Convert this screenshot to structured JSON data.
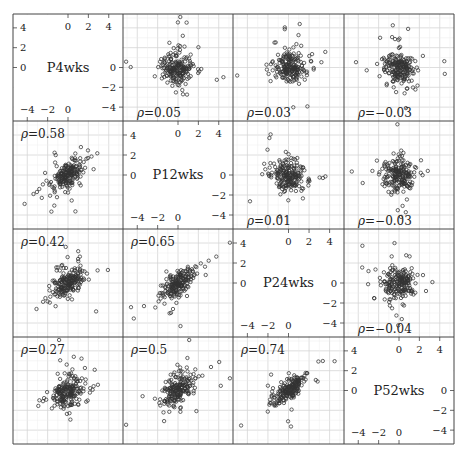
{
  "chart_data": {
    "type": "scatter",
    "title": "",
    "layout": "scatterplot-matrix",
    "variables": [
      "P4wks",
      "P12wks",
      "P24wks",
      "P52wks"
    ],
    "axis_range": [
      -5.4,
      5.4
    ],
    "ticks": [
      -4,
      -2,
      0,
      2,
      4
    ],
    "grid": true,
    "grid_step": 2,
    "correlations": [
      {
        "row": 0,
        "col": 1,
        "label": "ρ=0.05",
        "value": 0.05,
        "pos": "lower-left"
      },
      {
        "row": 0,
        "col": 2,
        "label": "ρ=0.03",
        "value": 0.03,
        "pos": "lower-left"
      },
      {
        "row": 0,
        "col": 3,
        "label": "ρ=−0.03",
        "value": -0.03,
        "pos": "lower-left"
      },
      {
        "row": 1,
        "col": 0,
        "label": "ρ=0.58",
        "value": 0.58,
        "pos": "upper-left"
      },
      {
        "row": 1,
        "col": 2,
        "label": "ρ=0.01",
        "value": 0.01,
        "pos": "lower-left"
      },
      {
        "row": 1,
        "col": 3,
        "label": "ρ=−0.03",
        "value": -0.03,
        "pos": "lower-left"
      },
      {
        "row": 2,
        "col": 0,
        "label": "ρ=0.42",
        "value": 0.42,
        "pos": "upper-left"
      },
      {
        "row": 2,
        "col": 1,
        "label": "ρ=0.65",
        "value": 0.65,
        "pos": "upper-left"
      },
      {
        "row": 2,
        "col": 3,
        "label": "ρ=−0.04",
        "value": -0.04,
        "pos": "lower-left"
      },
      {
        "row": 3,
        "col": 0,
        "label": "ρ=0.27",
        "value": 0.27,
        "pos": "upper-left"
      },
      {
        "row": 3,
        "col": 1,
        "label": "ρ=0.5",
        "value": 0.5,
        "pos": "upper-left"
      },
      {
        "row": 3,
        "col": 2,
        "label": "ρ=0.74",
        "value": 0.74,
        "pos": "upper-left"
      }
    ],
    "diagonal_axes": {
      "0": {
        "top": "x-ticks 0,2,4",
        "left": "y-ticks 4,2,0",
        "right": "y-ticks 0,-2,-4",
        "bottom": "x-ticks -4,-2,0"
      },
      "1": {
        "top": "x-ticks 0,2,4",
        "left": "y-ticks 4,2,0",
        "right": "y-ticks 0,-2,-4",
        "bottom": "x-ticks -4,-2,0"
      },
      "2": {
        "top": "x-ticks 0,2,4",
        "left": "y-ticks 4,2,0",
        "right": "y-ticks 0,-2,-4",
        "bottom": "x-ticks -4,-2,0"
      },
      "3": {
        "top": "x-ticks 0,2,4",
        "left": "y-ticks 4,2,0",
        "right": "y-ticks 0,-2,-4",
        "bottom": "x-ticks -4,-2,0"
      }
    },
    "points_per_panel": 200,
    "marker": "open-circle",
    "point_color": "#333333",
    "grid_color": "#d6d6d6",
    "frame_color": "#444444"
  }
}
